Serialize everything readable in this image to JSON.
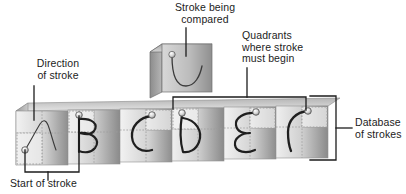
{
  "figure": {
    "type": "annotated-diagram",
    "background_color": "#ffffff",
    "ink_color": "#1c1c1c"
  },
  "labels": {
    "direction_of_stroke": "Direction\nof stroke",
    "stroke_being_compared": "Stroke being\ncompared",
    "quadrants_where_stroke_must_begin": "Quadrants\nwhere stroke\nmust begin",
    "database_of_strokes": "Database\nof strokes",
    "start_of_stroke": "Start of stroke"
  },
  "compared_tile": {
    "name": "stroke-being-compared-tile",
    "glyph": "u-curve",
    "has_start_dot": true,
    "face_fill_light": "#cfcfcf",
    "face_fill_dark": "#8d8d8d",
    "side_fill": "#6e6e6e"
  },
  "database_strip": {
    "name": "database-of-strokes-strip",
    "tile_count": 6,
    "tiles": [
      {
        "index": 1,
        "glyph": "lambda-curve",
        "glyph_label": "λ-stroke",
        "start_dot": "bottom-left",
        "quadrant_highlight": "bottom-left"
      },
      {
        "index": 2,
        "glyph": "B",
        "glyph_label": "B",
        "start_dot": "top-left",
        "quadrant_highlight": "top-left"
      },
      {
        "index": 3,
        "glyph": "C",
        "glyph_label": "C",
        "start_dot": "top-right",
        "quadrant_highlight": "top-right"
      },
      {
        "index": 4,
        "glyph": "D",
        "glyph_label": "D",
        "start_dot": "top-left",
        "quadrant_highlight": "top-left"
      },
      {
        "index": 5,
        "glyph": "E",
        "glyph_label": "Ɛ",
        "start_dot": "top-right",
        "quadrant_highlight": "top-right"
      },
      {
        "index": 6,
        "glyph": "Gamma-hook",
        "glyph_label": "Γ",
        "start_dot": "top-right",
        "quadrant_highlight": "top-right"
      }
    ]
  },
  "colors": {
    "ink": "#1c1c1c",
    "leader_line": "#1c1c1c",
    "tile_light": "#e8e8e8",
    "tile_mid": "#bdbdbd",
    "tile_dark": "#8a8a8a",
    "quadrant_dash": "#9a9a9a",
    "dot_fill": "#dcdcdc",
    "dot_edge": "#4a4a4a"
  }
}
